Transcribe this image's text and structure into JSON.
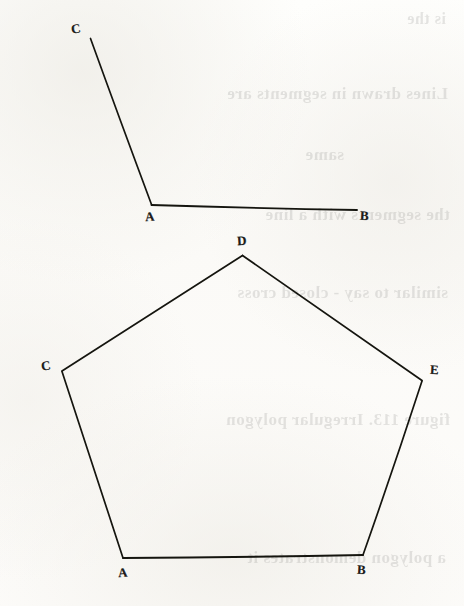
{
  "page": {
    "width": 464,
    "height": 606,
    "background_color": "#fdfdfb",
    "ink_color": "#15150f"
  },
  "figures": [
    {
      "id": "angle-figure",
      "type": "angle",
      "name": "angle CAB",
      "vertex_label": "A",
      "points": {
        "C": {
          "x": 90,
          "y": 37,
          "label": "C"
        },
        "A": {
          "x": 151,
          "y": 205,
          "label": "A"
        },
        "B": {
          "x": 357,
          "y": 210,
          "label": "B"
        }
      },
      "segments": [
        {
          "from": "C",
          "to": "A"
        },
        {
          "from": "A",
          "to": "B"
        }
      ],
      "labels": [
        {
          "text": "C",
          "x": 71,
          "y": 22
        },
        {
          "text": "A",
          "x": 145,
          "y": 210
        },
        {
          "text": "B",
          "x": 360,
          "y": 209
        }
      ]
    },
    {
      "id": "pentagon-figure",
      "type": "pentagon",
      "name": "pentagon A B E D C",
      "points": {
        "D": {
          "x": 242,
          "y": 255,
          "label": "D"
        },
        "E": {
          "x": 422,
          "y": 381,
          "label": "E"
        },
        "B": {
          "x": 363,
          "y": 555,
          "label": "B"
        },
        "A": {
          "x": 123,
          "y": 558,
          "label": "A"
        },
        "C": {
          "x": 62,
          "y": 371,
          "label": "C"
        }
      },
      "segments": [
        {
          "from": "D",
          "to": "E"
        },
        {
          "from": "E",
          "to": "B"
        },
        {
          "from": "B",
          "to": "A"
        },
        {
          "from": "A",
          "to": "C"
        },
        {
          "from": "C",
          "to": "D"
        }
      ],
      "labels": [
        {
          "text": "D",
          "x": 237,
          "y": 234
        },
        {
          "text": "E",
          "x": 430,
          "y": 363
        },
        {
          "text": "B",
          "x": 357,
          "y": 563
        },
        {
          "text": "A",
          "x": 118,
          "y": 566
        },
        {
          "text": "C",
          "x": 41,
          "y": 359
        }
      ]
    }
  ],
  "bleed_through": {
    "description": "faint mirrored show-through of writing from the reverse side of the sheet",
    "lines": [
      {
        "text": "is the",
        "x": 18,
        "y": 10,
        "size": 16
      },
      {
        "text": "Lines drawn  in segments  are",
        "x": 16,
        "y": 84,
        "size": 17
      },
      {
        "text": "same",
        "x": 120,
        "y": 145,
        "size": 17
      },
      {
        "text": "the  segments  with a line",
        "x": 14,
        "y": 205,
        "size": 17
      },
      {
        "text": "similar  to say  - closed  cross",
        "x": 16,
        "y": 283,
        "size": 17
      },
      {
        "text": "figure  113.   Irregular polygon",
        "x": 14,
        "y": 410,
        "size": 17
      },
      {
        "text": "a  polygon  demonstrates  it",
        "x": 18,
        "y": 548,
        "size": 17
      }
    ]
  }
}
